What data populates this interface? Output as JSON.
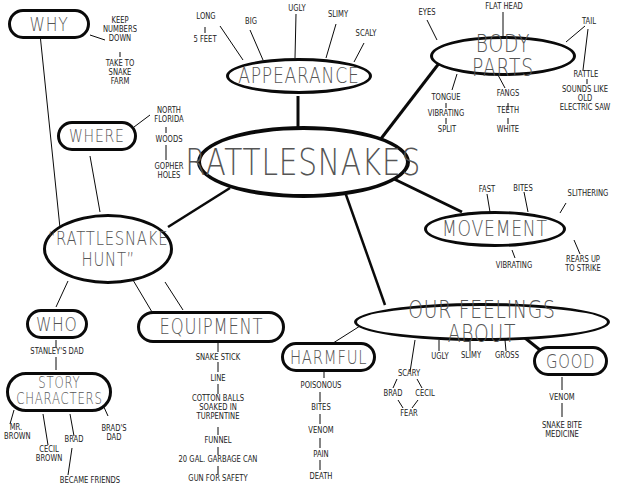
{
  "title": "RATTLESNAKES",
  "central": {
    "label": "RATTLESNAKES"
  },
  "appearance": {
    "label": "APPEARANCE",
    "items": [
      "LONG",
      "5 FEET",
      "BIG",
      "UGLY",
      "SLIMY",
      "SCALY"
    ]
  },
  "body_parts": {
    "label": "BODY PARTS",
    "items": [
      "EYES",
      "FLAT HEAD",
      "TAIL",
      "RATTLE",
      "SOUNDS LIKE\nOLD\nELECTRIC SAW",
      "TONGUE",
      "VIBRATING",
      "SPLIT",
      "FANGS",
      "TEETH",
      "WHITE"
    ]
  },
  "movement": {
    "label": "MOVEMENT",
    "items": [
      "FAST",
      "BITES",
      "SLITHERING",
      "VIBRATING",
      "REARS UP\nTO STRIKE"
    ]
  },
  "feelings": {
    "label": "OUR FEELINGS ABOUT",
    "items": [
      "UGLY",
      "SLIMY",
      "GROSS",
      "SCARY",
      "BRAD",
      "CECIL",
      "FEAR"
    ],
    "harmful": {
      "label": "HARMFUL",
      "items": [
        "POISONOUS",
        "BITES",
        "VENOM",
        "PAIN",
        "DEATH"
      ]
    },
    "good": {
      "label": "GOOD",
      "items": [
        "VENOM",
        "SNAKE BITE\nMEDICINE"
      ]
    }
  },
  "hunt": {
    "label": "“RATTLESNAKE\nHUNT”",
    "why": {
      "label": "WHY",
      "items": [
        "KEEP\nNUMBERS\nDOWN",
        "TAKE TO\nSNAKE\nFARM"
      ]
    },
    "where": {
      "label": "WHERE",
      "items": [
        "NORTH\nFLORIDA",
        "WOODS",
        "GOPHER\nHOLES"
      ]
    },
    "who": {
      "label": "WHO",
      "items": [
        "STANLEY'S DAD"
      ]
    },
    "story_characters": {
      "label": "STORY\nCHARACTERS",
      "items": [
        "MR.\nBROWN",
        "CECIL\nBROWN",
        "BRAD",
        "BRAD'S DAD",
        "BECAME FRIENDS"
      ]
    },
    "equipment": {
      "label": "EQUIPMENT",
      "items": [
        "SNAKE STICK",
        "LINE",
        "COTTON BALLS\nSOAKED IN\nTURPENTINE",
        "FUNNEL",
        "20 GAL. GARBAGE CAN",
        "GUN FOR SAFETY"
      ]
    }
  }
}
